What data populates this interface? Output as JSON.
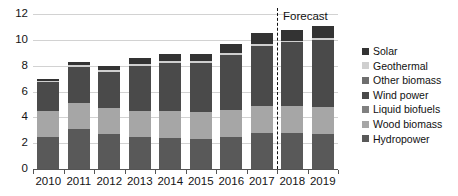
{
  "chart_data": {
    "type": "bar",
    "subtype": "stacked",
    "title": "",
    "xlabel": "",
    "ylabel": "",
    "categories": [
      "2010",
      "2011",
      "2012",
      "2013",
      "2014",
      "2015",
      "2016",
      "2017",
      "2018",
      "2019"
    ],
    "ylim": [
      0,
      12
    ],
    "yticks": [
      0,
      2,
      4,
      6,
      8,
      10,
      12
    ],
    "ytick_labels": [
      "0",
      "2",
      "4",
      "6",
      "8",
      "10",
      "12"
    ],
    "grid": true,
    "legend_position": "right",
    "series": [
      {
        "name": "Hydropower",
        "color": "#595959",
        "values": [
          2.5,
          3.1,
          2.7,
          2.5,
          2.4,
          2.3,
          2.5,
          2.8,
          2.8,
          2.7
        ]
      },
      {
        "name": "Wood biomass",
        "color": "#a6a6a6",
        "values": [
          2.0,
          2.0,
          2.0,
          2.0,
          2.1,
          2.1,
          2.1,
          2.1,
          2.1,
          2.1
        ]
      },
      {
        "name": "Liquid biofuels",
        "color": "#808080",
        "values": [
          0.0,
          0.0,
          0.0,
          0.0,
          0.0,
          0.0,
          0.0,
          0.0,
          0.0,
          0.0
        ]
      },
      {
        "name": "Wind power",
        "color": "#4a4a4a",
        "values": [
          2.2,
          2.8,
          2.8,
          3.5,
          3.7,
          3.8,
          4.2,
          4.6,
          4.9,
          5.2
        ]
      },
      {
        "name": "Other biomass",
        "color": "#6e6e6e",
        "values": [
          0.0,
          0.0,
          0.0,
          0.0,
          0.0,
          0.0,
          0.0,
          0.0,
          0.0,
          0.0
        ]
      },
      {
        "name": "Geothermal",
        "color": "#cfcfcf",
        "values": [
          0.15,
          0.15,
          0.15,
          0.15,
          0.15,
          0.15,
          0.15,
          0.15,
          0.15,
          0.15
        ]
      },
      {
        "name": "Solar",
        "color": "#333333",
        "values": [
          0.15,
          0.25,
          0.35,
          0.45,
          0.55,
          0.55,
          0.75,
          0.85,
          0.85,
          0.95
        ]
      }
    ],
    "annotations": [
      {
        "name": "forecast-divider",
        "label": "Forecast",
        "after_category": "2017"
      }
    ]
  },
  "legend": {
    "items": [
      {
        "label": "Solar",
        "color": "#333333"
      },
      {
        "label": "Geothermal",
        "color": "#cfcfcf"
      },
      {
        "label": "Other biomass",
        "color": "#6e6e6e"
      },
      {
        "label": "Wind power",
        "color": "#4a4a4a"
      },
      {
        "label": "Liquid biofuels",
        "color": "#808080"
      },
      {
        "label": "Wood biomass",
        "color": "#a6a6a6"
      },
      {
        "label": "Hydropower",
        "color": "#595959"
      }
    ]
  },
  "forecast": {
    "label": "Forecast"
  }
}
